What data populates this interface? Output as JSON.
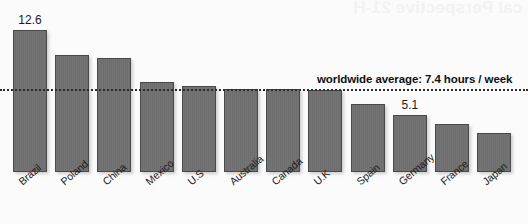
{
  "chart_data": {
    "type": "bar",
    "title": "",
    "xlabel": "",
    "ylabel": "",
    "ylim": [
      0,
      13.2
    ],
    "grid": false,
    "legend_position": "none",
    "categories": [
      "Brazil",
      "Poland",
      "China",
      "Mexico",
      "U.S",
      "Australia",
      "Canada",
      "U.K",
      "Spain",
      "Germany",
      "France",
      "Japan"
    ],
    "values": [
      12.6,
      10.4,
      10.1,
      8.0,
      7.6,
      7.4,
      7.4,
      7.3,
      6.0,
      5.1,
      4.3,
      3.5
    ],
    "data_labels": [
      {
        "category": "Brazil",
        "text": "12.6"
      },
      {
        "category": "Germany",
        "text": "5.1"
      }
    ],
    "annotations": [
      {
        "type": "reference-line",
        "value": 7.4,
        "style": "dotted",
        "label": "worldwide average: 7.4 hours / week"
      }
    ],
    "bar_color": "#6e6e6e",
    "bar_border_color": "#4a4a4a",
    "line_color": "#2b2b2b",
    "background": "#fbfbfb"
  },
  "annotation": {
    "average_label": "worldwide average: 7.4 hours / week"
  },
  "labels": {
    "max_value": "12.6",
    "germany_value": "5.1"
  },
  "bleed_through": {
    "text": "cal Perspective 21-H"
  }
}
